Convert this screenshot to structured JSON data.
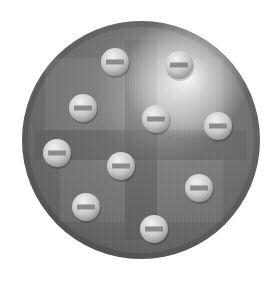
{
  "diagram": {
    "sphere": {
      "cx": 141,
      "cy": 140,
      "r": 119,
      "base_color": "#6f6f6f",
      "edge_color": "#4f4f4f",
      "highlight_color": "#f4f4f4",
      "highlight_center": [
        186,
        78
      ]
    },
    "positive_cross": {
      "vertical_band": {
        "x": 125,
        "width": 32
      },
      "horizontal_band": {
        "y": 130,
        "height": 30
      },
      "quadrants": [
        {
          "name": "upper-left",
          "x": 45,
          "y": 58,
          "w": 80,
          "h": 72
        },
        {
          "name": "upper-right",
          "x": 157,
          "y": 58,
          "w": 66,
          "h": 72
        },
        {
          "name": "lower-left",
          "x": 60,
          "y": 160,
          "w": 65,
          "h": 62
        },
        {
          "name": "lower-right",
          "x": 157,
          "y": 160,
          "w": 66,
          "h": 62
        }
      ]
    },
    "electrons": [
      {
        "cx": 115,
        "cy": 62,
        "r": 14,
        "symbol": "minus"
      },
      {
        "cx": 179,
        "cy": 65,
        "r": 14,
        "symbol": "minus"
      },
      {
        "cx": 83,
        "cy": 108,
        "r": 14,
        "symbol": "minus"
      },
      {
        "cx": 156,
        "cy": 119,
        "r": 14,
        "symbol": "minus"
      },
      {
        "cx": 218,
        "cy": 126,
        "r": 14,
        "symbol": "minus"
      },
      {
        "cx": 57,
        "cy": 153,
        "r": 14,
        "symbol": "minus"
      },
      {
        "cx": 121,
        "cy": 166,
        "r": 14,
        "symbol": "minus"
      },
      {
        "cx": 199,
        "cy": 188,
        "r": 14,
        "symbol": "minus"
      },
      {
        "cx": 86,
        "cy": 207,
        "r": 14,
        "symbol": "minus"
      },
      {
        "cx": 154,
        "cy": 229,
        "r": 14,
        "symbol": "minus"
      }
    ]
  }
}
